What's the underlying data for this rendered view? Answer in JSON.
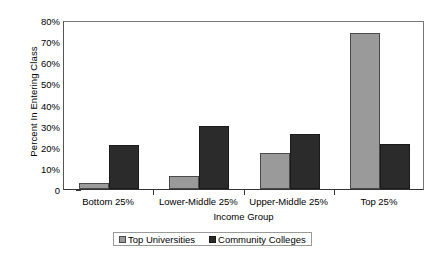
{
  "chart_data": {
    "type": "bar",
    "title": "",
    "xlabel": "Income Group",
    "ylabel": "Percent In Entering Class",
    "categories": [
      "Bottom 25%",
      "Lower-Middle 25%",
      "Upper-Middle 25%",
      "Top 25%"
    ],
    "series": [
      {
        "name": "Top Universities",
        "color": "#9a9a9a",
        "values": [
          3,
          6,
          17,
          74
        ]
      },
      {
        "name": "Community Colleges",
        "color": "#2b2b2b",
        "values": [
          21,
          30,
          26,
          21.5
        ]
      }
    ],
    "ylim": [
      0,
      80
    ],
    "ytick_labels": [
      "0",
      "10%",
      "20%",
      "30%",
      "40%",
      "50%",
      "60%",
      "70%",
      "80%"
    ],
    "ytick_values": [
      0,
      10,
      20,
      30,
      40,
      50,
      60,
      70,
      80
    ],
    "grid": false,
    "legend_position": "bottom"
  },
  "legend": {
    "entries": [
      {
        "label": "Top Universities"
      },
      {
        "label": "Community Colleges"
      }
    ]
  }
}
